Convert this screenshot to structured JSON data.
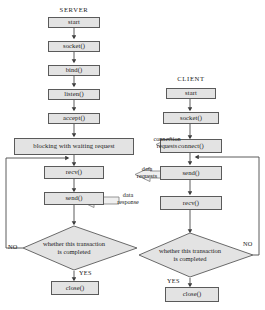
{
  "diagram": {
    "title_server": "SERVER",
    "title_client": "CLIENT",
    "colors": {
      "node_fill": "#e3e3e3",
      "node_stroke": "#5a5a5a",
      "line": "#4a4a4a",
      "text": "#1a1a1a",
      "background": "#ffffff"
    },
    "server_nodes": [
      {
        "id": "server-start",
        "label": "start"
      },
      {
        "id": "server-socket",
        "label": "socket()"
      },
      {
        "id": "server-bind",
        "label": "bind()"
      },
      {
        "id": "server-listen",
        "label": "listen()"
      },
      {
        "id": "server-accept",
        "label": "accept()"
      },
      {
        "id": "server-blocking",
        "label": "blocking with waiting request"
      },
      {
        "id": "server-recv",
        "label": "recv()"
      },
      {
        "id": "server-send",
        "label": "send()"
      },
      {
        "id": "server-close",
        "label": "close()"
      }
    ],
    "client_nodes": [
      {
        "id": "client-start",
        "label": "start"
      },
      {
        "id": "client-socket",
        "label": "socket()"
      },
      {
        "id": "client-connect",
        "label": "connect()"
      },
      {
        "id": "client-send",
        "label": "send()"
      },
      {
        "id": "client-recv",
        "label": "recv()"
      },
      {
        "id": "client-close",
        "label": "close()"
      }
    ],
    "decisions": [
      {
        "id": "server-decision",
        "line1": "whether this transaction",
        "line2": "is completed",
        "no_label": "NO",
        "yes_label": "YES"
      },
      {
        "id": "client-decision",
        "line1": "whether this transaction",
        "line2": "is completed",
        "no_label": "NO",
        "yes_label": "YES"
      }
    ],
    "messages": [
      {
        "id": "connection-requests",
        "line1": "connection",
        "line2": "requests",
        "direction": "client-to-server"
      },
      {
        "id": "data-requests",
        "line1": "data",
        "line2": "requests",
        "direction": "client-to-server"
      },
      {
        "id": "data-response",
        "line1": "data",
        "line2": "response",
        "direction": "server-to-client"
      }
    ]
  }
}
